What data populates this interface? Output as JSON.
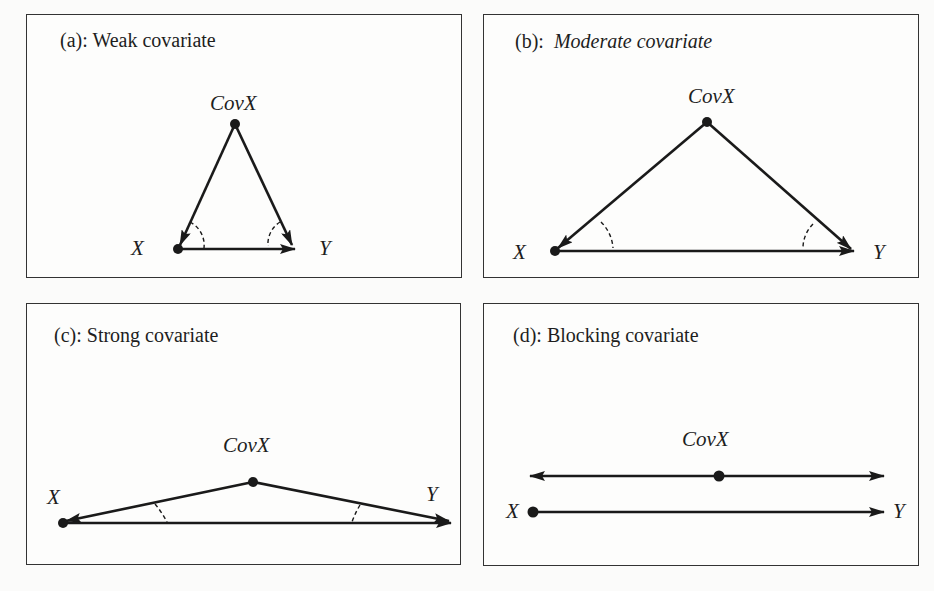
{
  "figure": {
    "panels": [
      {
        "id": "a",
        "prefix": "(a):",
        "title": "Weak covariate",
        "title_italic": false,
        "nodes": {
          "covx": "CovX",
          "x": "X",
          "y": "Y"
        }
      },
      {
        "id": "b",
        "prefix": "(b):",
        "title": "Moderate covariate",
        "title_italic": true,
        "nodes": {
          "covx": "CovX",
          "x": "X",
          "y": "Y"
        }
      },
      {
        "id": "c",
        "prefix": "(c):",
        "title": "Strong covariate",
        "title_italic": false,
        "nodes": {
          "covx": "CovX",
          "x": "X",
          "y": "Y"
        }
      },
      {
        "id": "d",
        "prefix": "(d):",
        "title": "Blocking covariate",
        "title_italic": false,
        "nodes": {
          "covx": "CovX",
          "x": "X",
          "y": "Y"
        }
      }
    ],
    "colors": {
      "line": "#1a1a1a",
      "border": "#333333",
      "background": "#fdfdfc"
    }
  }
}
